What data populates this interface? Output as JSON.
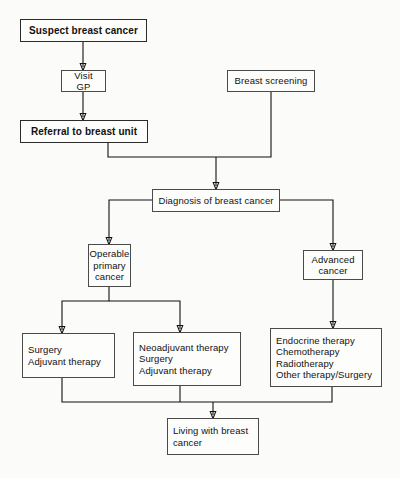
{
  "diagram": {
    "colors": {
      "background": "#fbfbf9",
      "node_fill": "#fdfdfb",
      "node_border": "#4a4a4a",
      "emphasis_border": "#2b2b2b",
      "connector": "#111111",
      "text": "#111111"
    },
    "nodes": [
      {
        "id": "suspect",
        "label": "Suspect breast cancer",
        "emphasis": true,
        "align": "center"
      },
      {
        "id": "visit_gp",
        "label": "Visit GP",
        "emphasis": false,
        "align": "center"
      },
      {
        "id": "breast_screening",
        "label": "Breast screening",
        "emphasis": false,
        "align": "center"
      },
      {
        "id": "referral",
        "label": "Referral to breast unit",
        "emphasis": true,
        "align": "center"
      },
      {
        "id": "diagnosis",
        "label": "Diagnosis of breast cancer",
        "emphasis": false,
        "align": "center"
      },
      {
        "id": "operable",
        "label": "Operable\nprimary\ncancer",
        "emphasis": false,
        "align": "center"
      },
      {
        "id": "advanced",
        "label": "Advanced\ncancer",
        "emphasis": false,
        "align": "center"
      },
      {
        "id": "surgery_adjuvant",
        "label": "Surgery\nAdjuvant therapy",
        "emphasis": false,
        "align": "left"
      },
      {
        "id": "neoadjuvant",
        "label": "Neoadjuvant therapy\nSurgery\nAdjuvant therapy",
        "emphasis": false,
        "align": "left"
      },
      {
        "id": "advanced_therapies",
        "label": "Endocrine therapy\nChemotherapy\nRadiotherapy\nOther therapy/Surgery",
        "emphasis": false,
        "align": "left"
      },
      {
        "id": "living",
        "label": "Living with breast\ncancer",
        "emphasis": false,
        "align": "left"
      }
    ],
    "edges": [
      {
        "from": "suspect",
        "to": "visit_gp"
      },
      {
        "from": "visit_gp",
        "to": "referral"
      },
      {
        "from": "referral",
        "to": "diagnosis"
      },
      {
        "from": "breast_screening",
        "to": "diagnosis"
      },
      {
        "from": "diagnosis",
        "to": "operable"
      },
      {
        "from": "diagnosis",
        "to": "advanced"
      },
      {
        "from": "operable",
        "to": "surgery_adjuvant"
      },
      {
        "from": "operable",
        "to": "neoadjuvant"
      },
      {
        "from": "advanced",
        "to": "advanced_therapies"
      },
      {
        "from": "surgery_adjuvant",
        "to": "living"
      },
      {
        "from": "neoadjuvant",
        "to": "living"
      },
      {
        "from": "advanced_therapies",
        "to": "living"
      }
    ]
  }
}
